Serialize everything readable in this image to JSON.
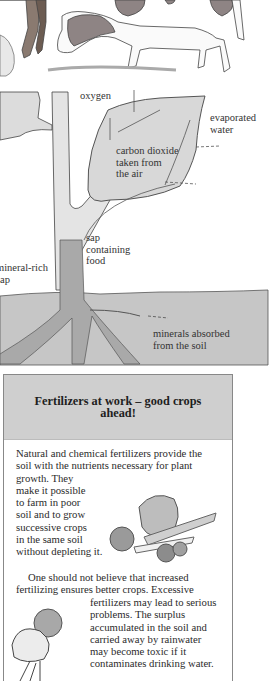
{
  "diagram": {
    "labels": {
      "oxygen": "oxygen",
      "evaporated_water": [
        "evaporated",
        "water"
      ],
      "carbon_dioxide": [
        "carbon dioxide",
        "taken from",
        "the air"
      ],
      "sap_food": [
        "sap",
        "containing",
        "food"
      ],
      "mineral_sap": [
        "mineral-rich",
        "sap"
      ],
      "minerals_absorbed": [
        "minerals absorbed",
        "from the soil"
      ]
    },
    "colors": {
      "leaf": "#d8d8d8",
      "soil": "#c8c8c8",
      "outline": "#444444"
    }
  },
  "box": {
    "title": "Fertilizers at work – good crops ahead!",
    "para1_full": [
      "Natural and chemical fertilizers provide the",
      "soil with the nutrients necessary for plant"
    ],
    "para1_narrow": [
      "growth. They",
      "make it possible",
      "to farm in poor",
      "soil and to grow",
      "successive crops",
      "in the same soil",
      "without depleting it."
    ],
    "para2_full": [
      "One should not believe that increased",
      "fertilizing ensures better crops. Excessive"
    ],
    "para2_narrow": [
      "fertilizers may lead to serious",
      "problems. The surplus",
      "accumulated in the soil and",
      "carried away by rainwater",
      "may become toxic if it",
      "contaminates drinking water."
    ],
    "header_color": "#cfcfcf"
  }
}
